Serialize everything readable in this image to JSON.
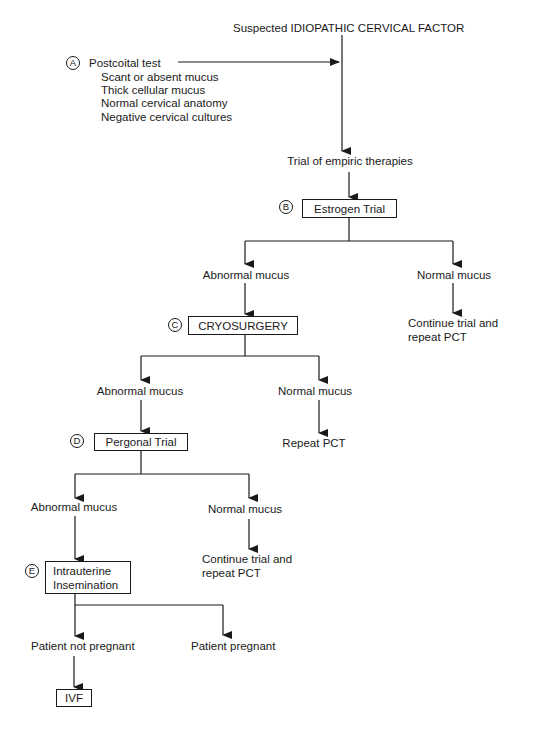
{
  "title": "Suspected IDIOPATHIC CERVICAL FACTOR",
  "postcoital": {
    "marker": "A",
    "label": "Postcoital test",
    "findings": [
      "Scant or absent mucus",
      "Thick cellular mucus",
      "Normal cervical anatomy",
      "Negative cervical cultures"
    ]
  },
  "trial_empiric": "Trial of empiric therapies",
  "step_b": {
    "marker": "B",
    "label": "Estrogen Trial",
    "abnormal": "Abnormal mucus",
    "normal": "Normal mucus",
    "normal_outcome": [
      "Continue trial and",
      "repeat PCT"
    ]
  },
  "step_c": {
    "marker": "C",
    "label": "CRYOSURGERY",
    "abnormal": "Abnormal mucus",
    "normal": "Normal mucus",
    "normal_outcome": "Repeat PCT"
  },
  "step_d": {
    "marker": "D",
    "label": "Pergonal Trial",
    "abnormal": "Abnormal mucus",
    "normal": "Normal mucus",
    "normal_outcome": [
      "Continue trial and",
      "repeat PCT"
    ]
  },
  "step_e": {
    "marker": "E",
    "label_lines": [
      "Intrauterine",
      "Insemination"
    ],
    "not_pregnant": "Patient not pregnant",
    "pregnant": "Patient pregnant"
  },
  "final": {
    "label": "IVF"
  }
}
